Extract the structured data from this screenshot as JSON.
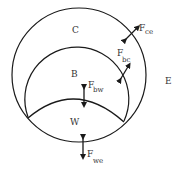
{
  "diagram": {
    "regions": {
      "C": "C",
      "B": "B",
      "W": "W",
      "E": "E"
    },
    "forces": [
      {
        "main": "F",
        "sub": "ce"
      },
      {
        "main": "F",
        "sub": "bc"
      },
      {
        "main": "F",
        "sub": "bw"
      },
      {
        "main": "F",
        "sub": "we"
      }
    ],
    "colors": {
      "stroke": "#1a1a1a",
      "text": "#333333",
      "background": "#ffffff"
    }
  }
}
